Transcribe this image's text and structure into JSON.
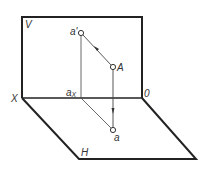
{
  "diagram": {
    "colors": {
      "line": "#222222",
      "thin_line": "#444444",
      "text": "#333333",
      "background": "#ffffff"
    },
    "planes": {
      "vertical": {
        "label": "V"
      },
      "horizontal": {
        "label": "H"
      }
    },
    "axis": {
      "x_label": "X",
      "origin_label": "0"
    },
    "points": {
      "space_point": {
        "label": "A"
      },
      "v_projection": {
        "label": "a'"
      },
      "h_projection": {
        "label": "a"
      },
      "axis_point": {
        "label": "a",
        "subscript": "X"
      }
    }
  }
}
